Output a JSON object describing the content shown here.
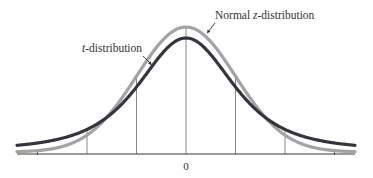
{
  "chart_data": {
    "type": "line",
    "title": "",
    "xlabel": "",
    "ylabel": "",
    "x_tick_labels": [
      "0"
    ],
    "xlim": [
      -3.5,
      3.5
    ],
    "grid": false,
    "legend_position": "annotations",
    "series": [
      {
        "name": "Normal z-distribution",
        "label_prefix": "Normal ",
        "label_italic": "z",
        "label_suffix": "-distribution",
        "color": "#a3a3a3",
        "kind": "normal",
        "peak": 0.399
      },
      {
        "name": "t-distribution",
        "label_prefix": "",
        "label_italic": "t",
        "label_suffix": "-distribution",
        "color": "#35353f",
        "kind": "t",
        "df": 3,
        "peak": 0.368
      }
    ],
    "vertical_lines_at": [
      -2,
      -1,
      0,
      1,
      2
    ],
    "axis_ticks_at": [
      -3,
      3
    ]
  },
  "annotations": {
    "normal_label": {
      "prefix": "Normal ",
      "italic": "z",
      "suffix": "-distribution"
    },
    "t_label": {
      "prefix": "",
      "italic": "t",
      "suffix": "-distribution"
    }
  }
}
